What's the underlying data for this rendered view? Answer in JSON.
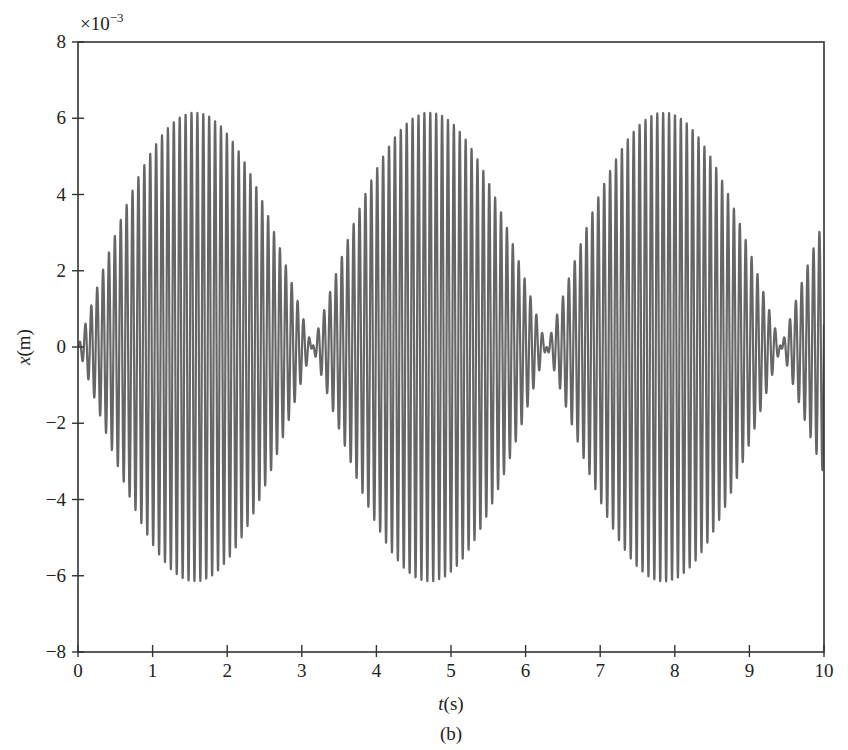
{
  "chart_data": {
    "type": "line",
    "title": "",
    "caption": "(b)",
    "xlabel": "t(s)",
    "xlabel_var": "t",
    "xlabel_unit": "(s)",
    "ylabel": "x(m)",
    "ylabel_var": "x",
    "ylabel_unit": "(m)",
    "y_exponent_label": "×10",
    "y_exponent_power": "−3",
    "xlim": [
      0,
      10
    ],
    "ylim": [
      -8,
      8
    ],
    "x_ticks": [
      0,
      1,
      2,
      3,
      4,
      5,
      6,
      7,
      8,
      9,
      10
    ],
    "x_tick_labels": [
      "0",
      "1",
      "2",
      "3",
      "4",
      "5",
      "6",
      "7",
      "8",
      "9",
      "10"
    ],
    "y_ticks": [
      -8,
      -6,
      -4,
      -2,
      0,
      2,
      4,
      6,
      8
    ],
    "y_tick_labels": [
      "−8",
      "−6",
      "−4",
      "−2",
      "0",
      "2",
      "4",
      "6",
      "8"
    ],
    "grid": false,
    "legend": null,
    "series": [
      {
        "name": "x(t) beat response",
        "color": "#666666",
        "description": "Beating oscillation: x(t) = A·sin(t)·sin(ωt), envelope period ≈ π s",
        "envelope_amplitude_x1e3": 6.15,
        "envelope_angular_freq": 1.0,
        "carrier_angular_freq": 79.5,
        "envelope_peaks_t": [
          1.57,
          4.71,
          7.85
        ],
        "envelope_nodes_t": [
          0,
          3.14,
          6.28,
          9.42
        ],
        "peak_value_x1e3": 6.15,
        "min_value_x1e3": -6.15
      }
    ]
  }
}
